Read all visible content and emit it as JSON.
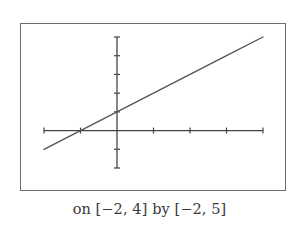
{
  "chart_data": {
    "type": "line",
    "title": "",
    "function": "y = x + 1",
    "series": [
      {
        "name": "y = x + 1",
        "x": [
          -2,
          -1,
          0,
          1,
          2,
          3,
          4
        ],
        "y": [
          -1,
          0,
          1,
          2,
          3,
          4,
          5
        ]
      }
    ],
    "xlim": [
      -2,
      4
    ],
    "ylim": [
      -2,
      5
    ],
    "xticks": [
      -2,
      -1,
      0,
      1,
      2,
      3,
      4
    ],
    "yticks": [
      -2,
      -1,
      0,
      1,
      2,
      3,
      4,
      5
    ],
    "xlabel": "",
    "ylabel": "",
    "grid": false,
    "legend": null,
    "caption": "on [−2, 4] by [−2, 5]",
    "colors": {
      "line": "#555555",
      "axes": "#444444",
      "frame": "#6e6e6e",
      "caption": "#3a3a3a"
    }
  },
  "caption_text": "on [−2, 4] by [−2, 5]"
}
